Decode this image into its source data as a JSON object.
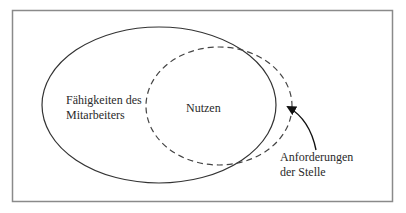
{
  "diagram": {
    "type": "venn-overlap",
    "frame": {
      "x": 12,
      "y": 10,
      "width": 380,
      "height": 191,
      "stroke": "#8a8a8a"
    },
    "shapes": [
      {
        "id": "faehigkeiten",
        "style": "solid",
        "cx": 159,
        "cy": 105,
        "rx": 117,
        "ry": 78,
        "stroke": "#333333"
      },
      {
        "id": "anforderungen",
        "style": "dashed",
        "cx": 219,
        "cy": 106,
        "rx": 73,
        "ry": 59,
        "stroke": "#444444"
      }
    ],
    "labels": {
      "faehigkeiten_line1": "Fähigkeiten des",
      "faehigkeiten_line2": "Mitarbeiters",
      "overlap": "Nutzen",
      "anforderungen_line1": "Anforderungen",
      "anforderungen_line2": "der Stelle"
    },
    "arrow": {
      "from": [
        316,
        150
      ],
      "to": [
        287,
        106
      ],
      "stroke": "#111111"
    }
  }
}
